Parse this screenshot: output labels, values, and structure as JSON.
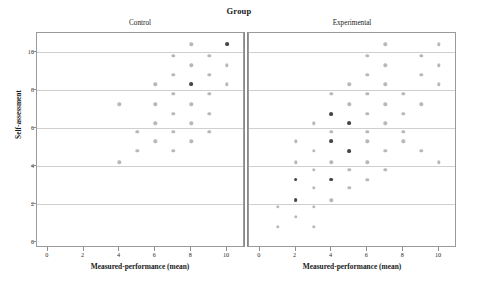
{
  "figure": {
    "title": "Group",
    "y_axis_title": "Self-assessment",
    "x_axis_title": "Measured-performance (mean)",
    "panel_labels": [
      "Control",
      "Experimental"
    ],
    "point_color": "#7d7d7d",
    "grid_color": "#cfcfcf",
    "frame_color": "#9a9a9a"
  },
  "chart_data": {
    "type": "scatter",
    "title": "Group",
    "xlabel": "Measured-performance (mean)",
    "ylabel": "Self-assessment",
    "xlim": [
      -0.6,
      11.0
    ],
    "ylim": [
      -0.3,
      11.0
    ],
    "xticks": [
      0,
      2,
      4,
      6,
      8,
      10
    ],
    "yticks": [
      0,
      2,
      4,
      6,
      8,
      10
    ],
    "grid": "horizontal",
    "legend": "none",
    "facet_variable": "Group",
    "facets": [
      {
        "name": "Control",
        "points": [
          [
            8.0,
            10.4
          ],
          [
            10.0,
            10.4
          ],
          [
            7.0,
            9.8
          ],
          [
            9.0,
            9.8
          ],
          [
            8.0,
            9.3
          ],
          [
            10.0,
            9.3
          ],
          [
            7.0,
            8.8
          ],
          [
            9.0,
            8.8
          ],
          [
            6.0,
            8.3
          ],
          [
            8.0,
            8.3
          ],
          [
            10.0,
            8.3
          ],
          [
            7.0,
            7.8
          ],
          [
            9.0,
            7.8
          ],
          [
            4.0,
            7.25
          ],
          [
            6.0,
            7.25
          ],
          [
            8.0,
            7.25
          ],
          [
            7.0,
            6.75
          ],
          [
            9.0,
            6.75
          ],
          [
            6.0,
            6.25
          ],
          [
            8.0,
            6.25
          ],
          [
            5.0,
            5.8
          ],
          [
            7.0,
            5.8
          ],
          [
            9.0,
            5.8
          ],
          [
            6.0,
            5.3
          ],
          [
            8.0,
            5.3
          ],
          [
            5.0,
            4.8
          ],
          [
            7.0,
            4.8
          ],
          [
            4.0,
            4.2
          ]
        ],
        "overlapping_points": [
          [
            10.0,
            10.4
          ],
          [
            8.0,
            8.3
          ]
        ]
      },
      {
        "name": "Experimental",
        "points": [
          [
            7.0,
            10.4
          ],
          [
            10.0,
            10.4
          ],
          [
            6.0,
            9.8
          ],
          [
            9.0,
            9.8
          ],
          [
            7.0,
            9.3
          ],
          [
            10.0,
            9.3
          ],
          [
            6.0,
            8.8
          ],
          [
            9.0,
            8.8
          ],
          [
            5.0,
            8.3
          ],
          [
            7.0,
            8.3
          ],
          [
            10.0,
            8.3
          ],
          [
            4.0,
            7.8
          ],
          [
            6.0,
            7.8
          ],
          [
            8.0,
            7.8
          ],
          [
            5.0,
            7.25
          ],
          [
            7.0,
            7.25
          ],
          [
            9.0,
            7.25
          ],
          [
            4.0,
            6.75
          ],
          [
            6.0,
            6.75
          ],
          [
            8.0,
            6.75
          ],
          [
            3.0,
            6.25
          ],
          [
            5.0,
            6.25
          ],
          [
            7.0,
            6.25
          ],
          [
            4.0,
            5.8
          ],
          [
            6.0,
            5.8
          ],
          [
            8.0,
            5.8
          ],
          [
            2.0,
            5.3
          ],
          [
            4.0,
            5.3
          ],
          [
            6.0,
            5.3
          ],
          [
            8.0,
            5.3
          ],
          [
            3.0,
            4.8
          ],
          [
            5.0,
            4.8
          ],
          [
            7.0,
            4.8
          ],
          [
            9.0,
            4.8
          ],
          [
            2.0,
            4.2
          ],
          [
            4.0,
            4.2
          ],
          [
            6.0,
            4.2
          ],
          [
            10.0,
            4.2
          ],
          [
            3.0,
            3.8
          ],
          [
            5.0,
            3.8
          ],
          [
            7.0,
            3.8
          ],
          [
            2.0,
            3.3
          ],
          [
            4.0,
            3.3
          ],
          [
            6.0,
            3.3
          ],
          [
            3.0,
            2.85
          ],
          [
            5.0,
            2.85
          ],
          [
            2.0,
            2.2
          ],
          [
            4.0,
            2.2
          ],
          [
            1.0,
            1.85
          ],
          [
            3.0,
            1.85
          ],
          [
            2.0,
            1.35
          ],
          [
            1.0,
            0.8
          ],
          [
            3.0,
            0.8
          ]
        ],
        "overlapping_points": [
          [
            5.0,
            4.8
          ],
          [
            4.0,
            5.3
          ],
          [
            4.0,
            3.3
          ],
          [
            2.0,
            3.3
          ],
          [
            2.0,
            2.2
          ],
          [
            5.0,
            6.25
          ],
          [
            6.0,
            6.25
          ],
          [
            4.0,
            6.75
          ]
        ]
      }
    ]
  },
  "axes": {
    "x_tick_labels": [
      "0",
      "2",
      "4",
      "6",
      "8",
      "10"
    ],
    "y_tick_labels": [
      "0",
      "2",
      "4",
      "6",
      "8",
      "10"
    ]
  }
}
